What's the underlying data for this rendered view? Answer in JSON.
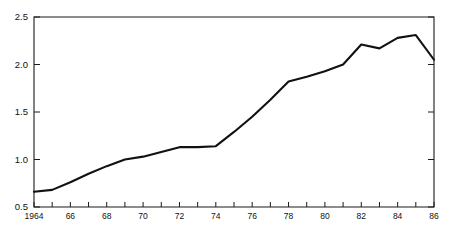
{
  "chart_data": {
    "type": "line",
    "title": "",
    "subtitle": "",
    "xlabel": "",
    "ylabel": "",
    "xlim": [
      1964,
      1986
    ],
    "ylim": [
      0.5,
      2.5
    ],
    "grid": false,
    "legend": null,
    "y_ticks": [
      0.5,
      1.0,
      1.5,
      2.0,
      2.5
    ],
    "y_tick_labels": [
      "0.5",
      "1.0",
      "1.5",
      "2.0",
      "2.5"
    ],
    "x_ticks": [
      1964,
      1965,
      1966,
      1967,
      1968,
      1969,
      1970,
      1971,
      1972,
      1973,
      1974,
      1975,
      1976,
      1977,
      1978,
      1979,
      1980,
      1981,
      1982,
      1983,
      1984,
      1985,
      1986
    ],
    "x_tick_labels": [
      "1964",
      "",
      "66",
      "",
      "68",
      "",
      "70",
      "",
      "72",
      "",
      "74",
      "",
      "76",
      "",
      "78",
      "",
      "80",
      "",
      "82",
      "",
      "84",
      "",
      "86"
    ],
    "x": [
      1964,
      1965,
      1966,
      1967,
      1968,
      1969,
      1970,
      1971,
      1972,
      1973,
      1974,
      1975,
      1976,
      1977,
      1978,
      1979,
      1980,
      1981,
      1982,
      1983,
      1984,
      1985,
      1986
    ],
    "values": [
      0.66,
      0.68,
      0.76,
      0.85,
      0.93,
      1.0,
      1.03,
      1.08,
      1.13,
      1.13,
      1.14,
      1.29,
      1.45,
      1.63,
      1.82,
      1.87,
      1.93,
      2.0,
      2.21,
      2.17,
      2.28,
      2.31,
      2.05
    ],
    "series": [
      {
        "name": "series-1",
        "color": "#111111",
        "values": [
          0.66,
          0.68,
          0.76,
          0.85,
          0.93,
          1.0,
          1.03,
          1.08,
          1.13,
          1.13,
          1.14,
          1.29,
          1.45,
          1.63,
          1.82,
          1.87,
          1.93,
          2.0,
          2.21,
          2.17,
          2.28,
          2.31,
          2.05
        ]
      }
    ]
  },
  "axes": {
    "frame_color": "#1a1a1a",
    "tick_direction": "in"
  }
}
